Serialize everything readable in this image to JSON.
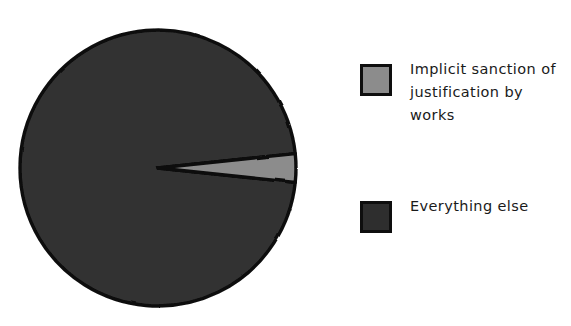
{
  "chart_data": {
    "type": "pie",
    "title": "",
    "subtitle": "",
    "xlabel": "",
    "ylabel": "",
    "grid": false,
    "legend_position": "right",
    "style": "hand-drawn",
    "background_color": "#ffffff",
    "categories": [
      "Implicit sanction of justification by works",
      "Everything else"
    ],
    "values": [
      3.5,
      96.5
    ],
    "units": "percent",
    "colors": [
      "#8c8c8c",
      "#333333"
    ],
    "edge_color": "#0c0c0c",
    "start_angle_deg": 6,
    "direction": "clockwise",
    "slices": [
      {
        "label": "Implicit sanction of justification by works",
        "value": 3.5,
        "color": "#8c8c8c",
        "start_angle_deg": -6,
        "end_angle_deg": 6,
        "exploded": false
      },
      {
        "label": "Everything else",
        "value": 96.5,
        "color": "#333333",
        "start_angle_deg": 6,
        "end_angle_deg": 354,
        "exploded": false
      }
    ],
    "annotations": []
  },
  "figure": {
    "background_color": "#ffffff"
  },
  "pie": {
    "center_x": 158,
    "center_y": 168,
    "radius": 138
  },
  "legend": {
    "entries": [
      {
        "label": "Implicit sanction of\njustification by works",
        "swatch_color": "#8c8c8c",
        "swatch_border": "#0e0e0e"
      },
      {
        "label": "Everything else",
        "swatch_color": "#2e2e2e",
        "swatch_border": "#0e0e0e"
      }
    ]
  }
}
